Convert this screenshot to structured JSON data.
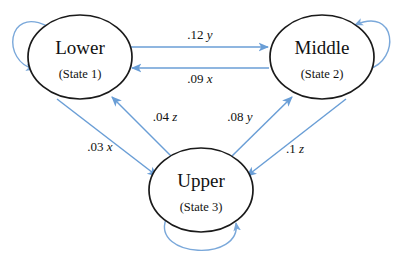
{
  "diagram": {
    "type": "state-transition-diagram",
    "background_color": "#ffffff",
    "node_stroke_color": "#1a1a1a",
    "edge_color": "#6a9ed6",
    "label_color": "#111111",
    "nodes": [
      {
        "id": "state1",
        "title": "Lower",
        "subtitle": "(State 1)",
        "cx": 80,
        "cy": 57,
        "rx": 52,
        "ry": 42
      },
      {
        "id": "state2",
        "title": "Middle",
        "subtitle": "(State 2)",
        "cx": 322,
        "cy": 57,
        "rx": 52,
        "ry": 42
      },
      {
        "id": "state3",
        "title": "Upper",
        "subtitle": "(State 3)",
        "cx": 201,
        "cy": 190,
        "rx": 52,
        "ry": 42
      }
    ],
    "edges": [
      {
        "id": "e-lower-middle",
        "from": "state1",
        "to": "state2",
        "coefficient": ".12",
        "variable": "y",
        "label": ".12 y"
      },
      {
        "id": "e-middle-lower",
        "from": "state2",
        "to": "state1",
        "coefficient": ".09",
        "variable": "x",
        "label": ".09 x"
      },
      {
        "id": "e-upper-lower",
        "from": "state3",
        "to": "state1",
        "coefficient": ".04",
        "variable": "z",
        "label": ".04 z"
      },
      {
        "id": "e-lower-upper",
        "from": "state1",
        "to": "state3",
        "coefficient": ".03",
        "variable": "x",
        "label": ".03 x"
      },
      {
        "id": "e-upper-middle",
        "from": "state3",
        "to": "state2",
        "coefficient": ".08",
        "variable": "y",
        "label": ".08 y"
      },
      {
        "id": "e-middle-upper",
        "from": "state2",
        "to": "state3",
        "coefficient": ".1",
        "variable": "z",
        "label": ".1 z"
      }
    ],
    "self_loops": [
      {
        "id": "loop-state1",
        "node": "state1",
        "position": "top-left"
      },
      {
        "id": "loop-state2",
        "node": "state2",
        "position": "top-right"
      },
      {
        "id": "loop-state3",
        "node": "state3",
        "position": "bottom"
      }
    ]
  }
}
